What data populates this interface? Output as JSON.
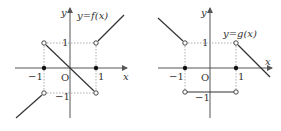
{
  "graphs": [
    {
      "name": "f",
      "label": "y=f(x)",
      "axis_x": "x",
      "axis_y": "y",
      "origin": "O",
      "tick_pos": "1",
      "tick_neg": "−1",
      "pieces": [
        {
          "domain": "x < -1",
          "formula": "y = x",
          "endpoint": "open at (-1,-1)"
        },
        {
          "domain": "-1 < x < 1",
          "formula": "y = -x",
          "endpoints": "open at (-1,1) and (1,-1)"
        },
        {
          "domain": "x > 1",
          "formula": "y = x",
          "endpoint": "open at (1,1)"
        }
      ],
      "filled_points": [
        "(-1,0)",
        "(1,0)"
      ]
    },
    {
      "name": "g",
      "label": "y=g(x)",
      "axis_x": "x",
      "axis_y": "y",
      "origin": "O",
      "tick_pos": "1",
      "tick_neg": "−1",
      "pieces": [
        {
          "domain": "x < -1",
          "formula": "y = -x",
          "endpoint": "open at (-1,1)"
        },
        {
          "domain": "-1 < x < 1",
          "formula": "y = -1",
          "endpoints": "open at (-1,-1) and (1,-1)"
        },
        {
          "domain": "x > 1",
          "formula": "y = -x + 2",
          "endpoint": "open at (1,1)"
        }
      ],
      "filled_points": [
        "(-1,0)",
        "(1,0)"
      ]
    }
  ],
  "colors": {
    "line": "#333333",
    "dashed": "#888888",
    "axis": "#555555"
  }
}
